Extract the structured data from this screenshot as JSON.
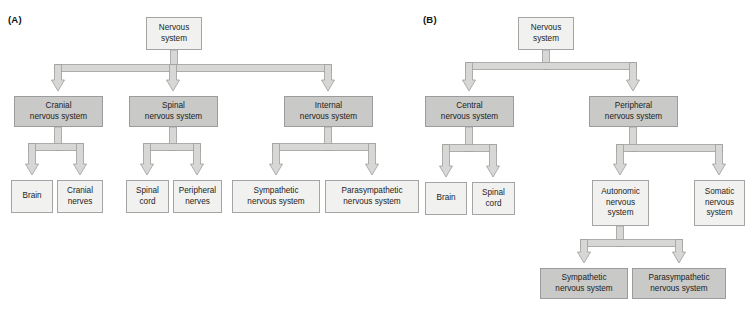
{
  "figure": {
    "type": "hierarchy-diagram",
    "background_color": "#ffffff",
    "box_fill_light": "#f1f1ef",
    "box_fill_dark": "#c9c9c7",
    "box_border_color": "#9c9c9c",
    "connector_fill": "#d7d7d5",
    "connector_border_color": "#9d9d9b"
  },
  "panels": [
    {
      "id": "panel-a",
      "label": "(A)",
      "label_x": 8,
      "label_y": 14,
      "nodes": [
        {
          "id": "a-nervous-system",
          "name": "node-nervous-system",
          "text": "Nervous\nsystem",
          "x": 146,
          "y": 17,
          "w": 56,
          "h": 33,
          "shade": "light"
        },
        {
          "id": "a-cranial-ns",
          "name": "node-cranial-nervous-system",
          "text": "Cranial\nnervous system",
          "x": 14,
          "y": 96,
          "w": 89,
          "h": 31,
          "shade": "dark"
        },
        {
          "id": "a-spinal-ns",
          "name": "node-spinal-nervous-system",
          "text": "Spinal\nnervous system",
          "x": 129,
          "y": 96,
          "w": 89,
          "h": 31,
          "shade": "dark"
        },
        {
          "id": "a-internal-ns",
          "name": "node-internal-nervous-system",
          "text": "Internal\nnervous system",
          "x": 284,
          "y": 96,
          "w": 89,
          "h": 31,
          "shade": "dark"
        },
        {
          "id": "a-brain",
          "name": "node-brain",
          "text": "Brain",
          "x": 11,
          "y": 180,
          "w": 42,
          "h": 33,
          "shade": "light"
        },
        {
          "id": "a-cranial-nerves",
          "name": "node-cranial-nerves",
          "text": "Cranial\nnerves",
          "x": 57,
          "y": 180,
          "w": 46,
          "h": 33,
          "shade": "light"
        },
        {
          "id": "a-spinal-cord",
          "name": "node-spinal-cord",
          "text": "Spinal\ncord",
          "x": 126,
          "y": 180,
          "w": 43,
          "h": 33,
          "shade": "light"
        },
        {
          "id": "a-peripheral-nerves",
          "name": "node-peripheral-nerves",
          "text": "Peripheral\nnerves",
          "x": 173,
          "y": 180,
          "w": 49,
          "h": 33,
          "shade": "light"
        },
        {
          "id": "a-sympathetic-ns",
          "name": "node-sympathetic-nervous-system",
          "text": "Sympathetic\nnervous system",
          "x": 232,
          "y": 180,
          "w": 88,
          "h": 33,
          "shade": "light"
        },
        {
          "id": "a-parasympathetic-ns",
          "name": "node-parasympathetic-nervous-system",
          "text": "Parasympathetic\nnervous system",
          "x": 325,
          "y": 180,
          "w": 94,
          "h": 33,
          "shade": "light"
        }
      ],
      "connectors": [
        {
          "name": "connector-nervous-to-level2",
          "type": "split",
          "stem_x": 174,
          "stem_y": 50,
          "bus_y": 68,
          "arrow_y": 91,
          "targets": [
            58,
            173,
            328
          ]
        },
        {
          "name": "connector-cranial-split",
          "type": "split",
          "stem_x": 58,
          "stem_y": 127,
          "bus_y": 147,
          "arrow_y": 175,
          "targets": [
            32,
            80
          ]
        },
        {
          "name": "connector-spinal-split",
          "type": "split",
          "stem_x": 173,
          "stem_y": 127,
          "bus_y": 147,
          "arrow_y": 175,
          "targets": [
            147,
            197
          ]
        },
        {
          "name": "connector-internal-split",
          "type": "split",
          "stem_x": 328,
          "stem_y": 127,
          "bus_y": 147,
          "arrow_y": 175,
          "targets": [
            276,
            372
          ]
        }
      ]
    },
    {
      "id": "panel-b",
      "label": "(B)",
      "label_x": 423,
      "label_y": 14,
      "nodes": [
        {
          "id": "b-nervous-system",
          "name": "node-nervous-system",
          "text": "Nervous\nsystem",
          "x": 518,
          "y": 17,
          "w": 56,
          "h": 33,
          "shade": "light"
        },
        {
          "id": "b-central-ns",
          "name": "node-central-nervous-system",
          "text": "Central\nnervous system",
          "x": 425,
          "y": 96,
          "w": 89,
          "h": 31,
          "shade": "dark"
        },
        {
          "id": "b-peripheral-ns",
          "name": "node-peripheral-nervous-system",
          "text": "Peripheral\nnervous system",
          "x": 589,
          "y": 96,
          "w": 89,
          "h": 31,
          "shade": "dark"
        },
        {
          "id": "b-brain",
          "name": "node-brain",
          "text": "Brain",
          "x": 425,
          "y": 182,
          "w": 42,
          "h": 33,
          "shade": "light"
        },
        {
          "id": "b-spinal-cord",
          "name": "node-spinal-cord",
          "text": "Spinal\ncord",
          "x": 472,
          "y": 182,
          "w": 43,
          "h": 33,
          "shade": "light"
        },
        {
          "id": "b-autonomic-ns",
          "name": "node-autonomic-nervous-system",
          "text": "Autonomic\nnervous\nsystem",
          "x": 592,
          "y": 180,
          "w": 57,
          "h": 46,
          "shade": "light"
        },
        {
          "id": "b-somatic-ns",
          "name": "node-somatic-nervous-system",
          "text": "Somatic\nnervous\nsystem",
          "x": 694,
          "y": 180,
          "w": 51,
          "h": 46,
          "shade": "light"
        },
        {
          "id": "b-sympathetic-ns",
          "name": "node-sympathetic-nervous-system",
          "text": "Sympathetic\nnervous system",
          "x": 540,
          "y": 268,
          "w": 88,
          "h": 31,
          "shade": "dark"
        },
        {
          "id": "b-parasympathetic-ns",
          "name": "node-parasympathetic-nervous-system",
          "text": "Parasympathetic\nnervous system",
          "x": 632,
          "y": 268,
          "w": 94,
          "h": 31,
          "shade": "dark"
        }
      ],
      "connectors": [
        {
          "name": "connector-nervous-to-level2",
          "type": "split",
          "stem_x": 546,
          "stem_y": 50,
          "bus_y": 66,
          "arrow_y": 91,
          "targets": [
            469,
            633
          ]
        },
        {
          "name": "connector-central-split",
          "type": "split",
          "stem_x": 469,
          "stem_y": 127,
          "bus_y": 148,
          "arrow_y": 177,
          "targets": [
            446,
            493
          ]
        },
        {
          "name": "connector-peripheral-split",
          "type": "split",
          "stem_x": 633,
          "stem_y": 127,
          "bus_y": 148,
          "arrow_y": 175,
          "targets": [
            620,
            719
          ]
        },
        {
          "name": "connector-autonomic-split",
          "type": "split",
          "stem_x": 620,
          "stem_y": 226,
          "bus_y": 243,
          "arrow_y": 263,
          "targets": [
            584,
            679
          ]
        }
      ]
    }
  ]
}
